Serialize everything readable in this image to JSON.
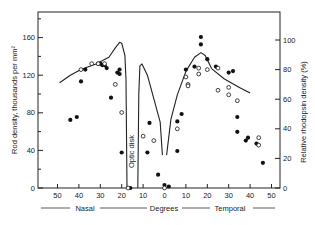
{
  "chart_data": {
    "type": "scatter",
    "title": "",
    "xlabel": "Degrees",
    "xlabel_left": "Nasal",
    "xlabel_right": "Temporal",
    "ylabel_left": "Rod density, thousands per mm²",
    "ylabel_right": "Relative rhodopsin density (%)",
    "annotation": "Optic disk",
    "x_ticks": [
      {
        "pos": -50,
        "label": "50"
      },
      {
        "pos": -40,
        "label": "40"
      },
      {
        "pos": -30,
        "label": "30"
      },
      {
        "pos": -20,
        "label": "20"
      },
      {
        "pos": -10,
        "label": "10"
      },
      {
        "pos": 0,
        "label": "0"
      },
      {
        "pos": 10,
        "label": "10"
      },
      {
        "pos": 20,
        "label": "20"
      },
      {
        "pos": 30,
        "label": "30"
      },
      {
        "pos": 40,
        "label": "40"
      },
      {
        "pos": 50,
        "label": "50"
      }
    ],
    "y_left_ticks": [
      0,
      40,
      80,
      120,
      160
    ],
    "y_right_ticks": [
      0,
      20,
      40,
      60,
      80,
      100
    ],
    "xlim": [
      -57,
      54
    ],
    "ylim_left": [
      0,
      187
    ],
    "ylim_right": [
      0,
      125
    ],
    "grid": false,
    "series": [
      {
        "name": "Rod density (curve)",
        "kind": "line",
        "axis": "left",
        "segments": [
          [
            [
              -49,
              112
            ],
            [
              -44,
              120
            ],
            [
              -39,
              126
            ],
            [
              -32,
              132
            ],
            [
              -26,
              139
            ],
            [
              -23,
              149
            ],
            [
              -21,
              155
            ],
            [
              -20,
              154
            ],
            [
              -18.5,
              141
            ],
            [
              -18,
              115
            ],
            [
              -17.5,
              0
            ]
          ],
          [
            [
              -12.5,
              0
            ],
            [
              -12,
              100
            ],
            [
              -11.5,
              130
            ],
            [
              -10.5,
              132
            ],
            [
              -8,
              120
            ],
            [
              -5,
              95
            ],
            [
              -2,
              70
            ],
            [
              -1,
              35
            ]
          ],
          [
            [
              1,
              35
            ],
            [
              3,
              73
            ],
            [
              6,
              99
            ],
            [
              10,
              124
            ],
            [
              14,
              139
            ],
            [
              17,
              144
            ],
            [
              19,
              141
            ],
            [
              22,
              127
            ],
            [
              28,
              116
            ],
            [
              35,
              107
            ],
            [
              40,
              101
            ]
          ]
        ]
      },
      {
        "name": "Rhodopsin density (filled circles)",
        "kind": "scatter",
        "marker": "filled",
        "axis": "right",
        "points": [
          [
            -44,
            46
          ],
          [
            -41,
            48
          ],
          [
            -39,
            72
          ],
          [
            -37,
            80
          ],
          [
            -31,
            84
          ],
          [
            -30,
            84
          ],
          [
            -29,
            83
          ],
          [
            -28,
            83
          ],
          [
            -27,
            81
          ],
          [
            -22,
            78
          ],
          [
            -21,
            80
          ],
          [
            -21,
            77
          ],
          [
            -25,
            61
          ],
          [
            -20,
            24
          ],
          [
            -16,
            0
          ],
          [
            -7,
            44
          ],
          [
            -8,
            24
          ],
          [
            -3,
            9
          ],
          [
            0,
            2
          ],
          [
            2,
            1
          ],
          [
            6,
            45
          ],
          [
            8,
            50
          ],
          [
            6,
            25
          ],
          [
            10,
            80
          ],
          [
            14,
            82
          ],
          [
            17,
            102
          ],
          [
            17,
            97
          ],
          [
            20,
            87
          ],
          [
            24,
            82
          ],
          [
            30,
            78
          ],
          [
            32,
            79
          ],
          [
            34,
            48
          ],
          [
            34,
            38
          ],
          [
            38,
            32
          ],
          [
            39,
            34
          ],
          [
            43,
            30
          ],
          [
            46,
            17
          ]
        ]
      },
      {
        "name": "Rhodopsin density (open circles)",
        "kind": "scatter",
        "marker": "open",
        "axis": "right",
        "points": [
          [
            -39,
            80
          ],
          [
            -34,
            84
          ],
          [
            -31,
            84
          ],
          [
            -28,
            84
          ],
          [
            -23,
            70
          ],
          [
            -20,
            51
          ],
          [
            -17,
            0
          ],
          [
            -10,
            35
          ],
          [
            -5,
            32
          ],
          [
            0,
            0
          ],
          [
            6,
            40
          ],
          [
            10,
            75
          ],
          [
            11,
            70
          ],
          [
            11,
            69
          ],
          [
            16,
            81
          ],
          [
            16,
            77
          ],
          [
            20,
            80
          ],
          [
            25,
            81
          ],
          [
            25,
            66
          ],
          [
            30,
            68
          ],
          [
            30,
            63
          ],
          [
            34,
            59
          ],
          [
            44,
            34
          ],
          [
            44,
            29
          ]
        ]
      }
    ]
  }
}
